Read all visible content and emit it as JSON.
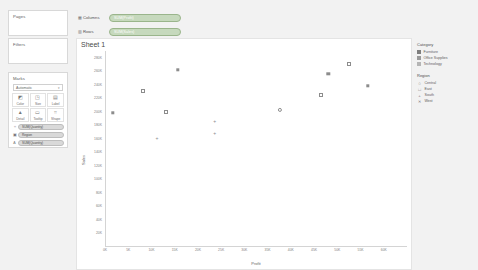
{
  "app": {
    "sheet_title": "Sheet 1"
  },
  "left_panel": {
    "pages": {
      "title": "Pages"
    },
    "filters": {
      "title": "Filters"
    },
    "marks": {
      "title": "Marks",
      "mark_type": "Automatic",
      "caret": "▾",
      "buttons": [
        {
          "label": "Color",
          "icon": "color-icon",
          "glyph": "◩"
        },
        {
          "label": "Size",
          "icon": "size-icon",
          "glyph": "◳"
        },
        {
          "label": "Label",
          "icon": "label-icon",
          "glyph": "▤"
        },
        {
          "label": "Detail",
          "icon": "detail-icon",
          "glyph": "▲"
        },
        {
          "label": "Tooltip",
          "icon": "tooltip-icon",
          "glyph": "▭"
        },
        {
          "label": "Shape",
          "icon": "shape-icon",
          "glyph": "⌗"
        }
      ],
      "pills": [
        {
          "glyph": "⌗",
          "text": "SUM(Quantity)"
        },
        {
          "glyph": "▣",
          "text": "Region"
        },
        {
          "glyph": "A",
          "text": "SUM(Quantity)"
        }
      ]
    }
  },
  "shelves": {
    "columns": {
      "label": "Columns",
      "icon": "columns-icon",
      "glyph": "▦",
      "pill": "SUM(Profit)"
    },
    "rows": {
      "label": "Rows",
      "icon": "rows-icon",
      "glyph": "▥",
      "pill": "SUM(Sales)"
    }
  },
  "legend": {
    "category": {
      "title": "Category",
      "items": [
        {
          "label": "Furniture",
          "color": "#7e7e7e"
        },
        {
          "label": "Office Supplies",
          "color": "#9a9a9a"
        },
        {
          "label": "Technology",
          "color": "#b5b5b5"
        }
      ]
    },
    "region": {
      "title": "Region",
      "items": [
        {
          "label": "Central",
          "shape": "circle-open-marker",
          "glyph": "○"
        },
        {
          "label": "East",
          "shape": "square-open-marker",
          "glyph": "□"
        },
        {
          "label": "South",
          "shape": "plus-marker",
          "glyph": "+"
        },
        {
          "label": "West",
          "shape": "x-marker",
          "glyph": "✕"
        }
      ]
    }
  },
  "chart_data": {
    "type": "scatter",
    "title": "Sheet 1",
    "xlabel": "Profit",
    "ylabel": "Sales",
    "xlim": [
      0,
      65000
    ],
    "ylim": [
      0,
      290000
    ],
    "x_ticks": [
      "0K",
      "5K",
      "10K",
      "15K",
      "20K",
      "25K",
      "30K",
      "35K",
      "40K",
      "45K",
      "50K",
      "55K",
      "60K"
    ],
    "x_tick_values": [
      0,
      5000,
      10000,
      15000,
      20000,
      25000,
      30000,
      35000,
      40000,
      45000,
      50000,
      55000,
      60000
    ],
    "y_ticks": [
      "280K",
      "260K",
      "240K",
      "220K",
      "200K",
      "180K",
      "160K",
      "140K",
      "120K",
      "100K",
      "80K",
      "60K",
      "40K",
      "20K"
    ],
    "y_tick_values": [
      280000,
      260000,
      240000,
      220000,
      200000,
      180000,
      160000,
      140000,
      120000,
      100000,
      80000,
      60000,
      40000,
      20000
    ],
    "grid": false,
    "legend_position": "right",
    "points": [
      {
        "x": 15500,
        "y": 262000,
        "category": "Technology",
        "region": "East",
        "shape": "square-fill"
      },
      {
        "x": 52500,
        "y": 270000,
        "category": "Technology",
        "region": "East",
        "shape": "square-open"
      },
      {
        "x": 48000,
        "y": 256000,
        "category": "Technology",
        "region": "West",
        "shape": "square-fill"
      },
      {
        "x": 56500,
        "y": 238000,
        "category": "Furniture",
        "region": "West",
        "shape": "square-fill"
      },
      {
        "x": 8000,
        "y": 230000,
        "category": "Office Supplies",
        "region": "East",
        "shape": "square-open"
      },
      {
        "x": 46500,
        "y": 224000,
        "category": "Office Supplies",
        "region": "West",
        "shape": "square-open"
      },
      {
        "x": 37500,
        "y": 202000,
        "category": "Technology",
        "region": "Central",
        "shape": "circle-open"
      },
      {
        "x": 13000,
        "y": 200000,
        "category": "Office Supplies",
        "region": "Central",
        "shape": "square-open"
      },
      {
        "x": 1500,
        "y": 198000,
        "category": "Furniture",
        "region": "Central",
        "shape": "square-fill"
      },
      {
        "x": 23500,
        "y": 186000,
        "category": "Furniture",
        "region": "South",
        "shape": "plus"
      },
      {
        "x": 23500,
        "y": 168000,
        "category": "Furniture",
        "region": "South",
        "shape": "plus"
      },
      {
        "x": 11000,
        "y": 160000,
        "category": "Furniture",
        "region": "South",
        "shape": "plus"
      }
    ]
  }
}
